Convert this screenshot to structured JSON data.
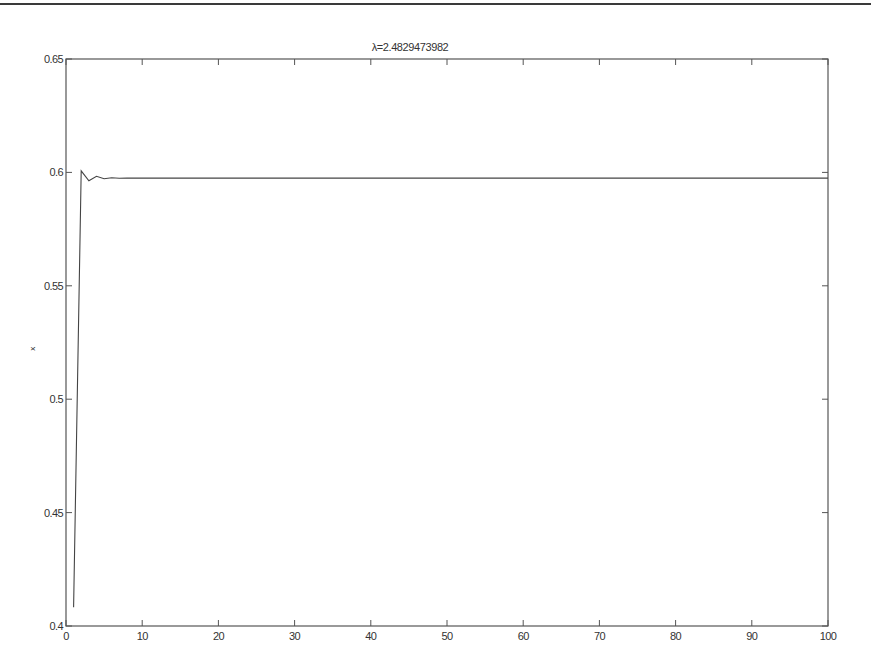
{
  "chart_data": {
    "type": "line",
    "title": "λ=2.4829473982",
    "xlabel": "",
    "ylabel": "x",
    "xlim": [
      0,
      100
    ],
    "ylim": [
      0.4,
      0.65
    ],
    "grid": false,
    "legend": null,
    "x_ticks": [
      0,
      10,
      20,
      30,
      40,
      50,
      60,
      70,
      80,
      90,
      100
    ],
    "x_tick_labels": [
      "0",
      "10",
      "20",
      "30",
      "40",
      "50",
      "60",
      "70",
      "80",
      "90",
      "100"
    ],
    "y_ticks": [
      0.4,
      0.45,
      0.5,
      0.55,
      0.6,
      0.65
    ],
    "y_tick_labels": [
      "0.4",
      "0.45",
      "0.5",
      "0.55",
      "0.6",
      "0.65"
    ],
    "series": [
      {
        "name": "x",
        "color": "#444444",
        "x": [
          1,
          2,
          3,
          4,
          5,
          6,
          7,
          8,
          10,
          20,
          30,
          40,
          50,
          60,
          70,
          80,
          90,
          100
        ],
        "values": [
          0.4083,
          0.6007,
          0.5963,
          0.5983,
          0.5972,
          0.5976,
          0.5974,
          0.5975,
          0.5975,
          0.5975,
          0.5975,
          0.5975,
          0.5975,
          0.5975,
          0.5975,
          0.5975,
          0.5975,
          0.5975
        ]
      }
    ]
  },
  "colors": {
    "axis": "#555555",
    "line": "#444444",
    "text": "#333333",
    "top_rule": "#3a3a3a"
  }
}
